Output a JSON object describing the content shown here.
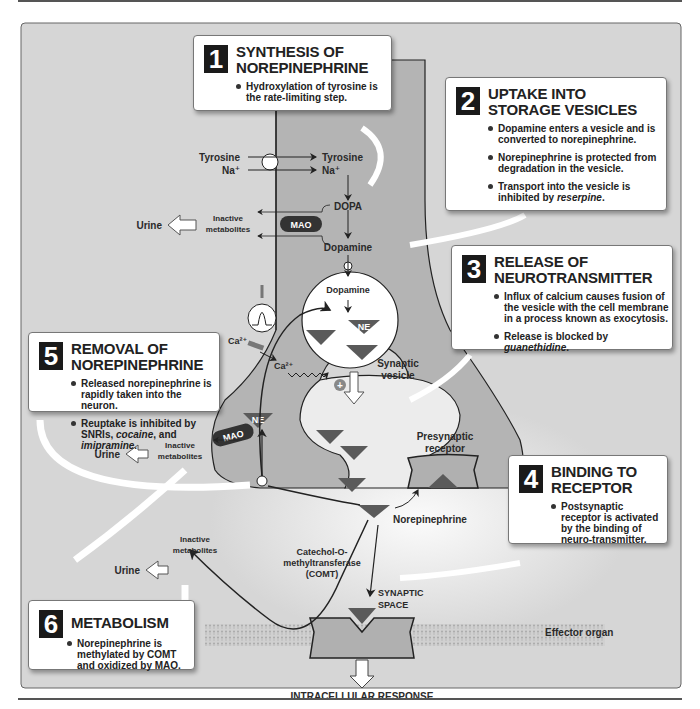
{
  "boxes": {
    "b1": {
      "num": "1",
      "title1": "SYNTHESIS OF",
      "title2": "NOREPINEPHRINE",
      "bullets": [
        "Hydroxylation of tyrosine is the rate-limiting step."
      ]
    },
    "b2": {
      "num": "2",
      "title1": "UPTAKE INTO",
      "title2": "STORAGE VESICLES",
      "bullets": [
        "Dopamine enters a vesicle and is converted to norepinephrine.",
        "Norepinephrine is protected from degradation in the vesicle.",
        "Transport into the vesicle is inhibited by "
      ],
      "b3_italic": "reserpine",
      "b3_end": "."
    },
    "b3": {
      "num": "3",
      "title1": "RELEASE OF",
      "title2": "NEUROTRANSMITTER",
      "bullets": [
        "Influx of calcium causes fusion of the vesicle with the cell membrane in a process known as exocytosis.",
        "Release is blocked by "
      ],
      "b2_italic": "guanethidine",
      "b2_end": "."
    },
    "b4": {
      "num": "4",
      "title1": "BINDING TO",
      "title2": "RECEPTOR",
      "bullets": [
        "Postsynaptic receptor is activated by the binding of neuro-transmitter."
      ]
    },
    "b5": {
      "num": "5",
      "title1": "REMOVAL OF",
      "title2": "NOREPINEPHRINE",
      "bullets": [
        "Released norepinephrine is rapidly taken into the neuron.",
        "Reuptake is inhibited by SNRIs, "
      ],
      "b2_italic1": "cocaine",
      "b2_mid": ", and ",
      "b2_italic2": "imipramine",
      "b2_end": "."
    },
    "b6": {
      "num": "6",
      "title1": "METABOLISM",
      "bullets": [
        "Norepinephrine is methylated by COMT and oxidized by MAO."
      ]
    }
  },
  "labels": {
    "tyrosine_out": "Tyrosine",
    "na_out": "Na⁺",
    "tyrosine_in": "Tyrosine",
    "na_in": "Na⁺",
    "dopa": "DOPA",
    "dopamine_cyto": "Dopamine",
    "dopamine_vesicle": "Dopamine",
    "inactive1": "Inactive",
    "metabolites1": "metabolites",
    "urine1": "Urine",
    "mao": "MAO",
    "ne": "NE",
    "ca_out": "Ca²⁺",
    "ca_in": "Ca²⁺",
    "plus": "+",
    "synaptic": "Synaptic",
    "vesicle": "vesicle",
    "presynaptic": "Presynaptic",
    "receptor": "receptor",
    "urine2": "Urine",
    "inactive2": "Inactive",
    "metabolites2": "metabolites",
    "norepinephrine": "Norepinephrine",
    "urine3": "Urine",
    "inactive3": "Inactive",
    "metabolites3": "metabolites",
    "comt1": "Catechol-O-",
    "comt2": "methyltransferase",
    "comt3": "(COMT)",
    "synaptic_space1": "SYNAPTIC",
    "synaptic_space2": "SPACE",
    "effector": "Effector organ",
    "response": "INTRACELLULAR RESPONSE"
  },
  "colors": {
    "background_panel": "#d6d6d6",
    "neuron_fill": "#b4b4b4",
    "ne_triangle": "#5a5a5a",
    "box_number_bg": "#1a1a1a"
  }
}
